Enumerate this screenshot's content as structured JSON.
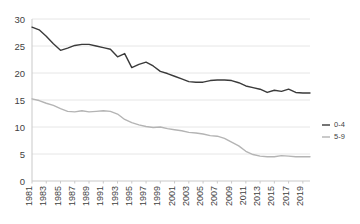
{
  "chart_data": {
    "type": "line",
    "title": "",
    "subtitle": "",
    "xlabel": "",
    "ylabel": "",
    "grid": true,
    "legend_position": "right",
    "ylim": [
      0,
      30
    ],
    "yticks": [
      0,
      5,
      10,
      15,
      20,
      25,
      30
    ],
    "ytick_labels": [
      "0",
      "5",
      "10",
      "15",
      "20",
      "25",
      "30"
    ],
    "xlim": [
      1981,
      2020
    ],
    "xticks": [
      1981,
      1983,
      1985,
      1987,
      1989,
      1991,
      1993,
      1995,
      1997,
      1999,
      2001,
      2003,
      2005,
      2007,
      2009,
      2011,
      2013,
      2015,
      2017,
      2019
    ],
    "xtick_labels": [
      "1981",
      "1983",
      "1985",
      "1987",
      "1989",
      "1991",
      "1993",
      "1995",
      "1997",
      "1999",
      "2001",
      "2003",
      "2005",
      "2007",
      "2009",
      "2011",
      "2013",
      "2015",
      "2017",
      "2019"
    ],
    "x": [
      1981,
      1982,
      1983,
      1984,
      1985,
      1986,
      1987,
      1988,
      1989,
      1990,
      1991,
      1992,
      1993,
      1994,
      1995,
      1996,
      1997,
      1998,
      1999,
      2000,
      2001,
      2002,
      2003,
      2004,
      2005,
      2006,
      2007,
      2008,
      2009,
      2010,
      2011,
      2012,
      2013,
      2014,
      2015,
      2016,
      2017,
      2018,
      2019,
      2020
    ],
    "series": [
      {
        "name": "0-4",
        "color": "#3a3a3a",
        "values": [
          28.5,
          28.0,
          26.8,
          25.4,
          24.2,
          24.6,
          25.1,
          25.3,
          25.3,
          25.0,
          24.7,
          24.4,
          23.0,
          23.6,
          21.0,
          21.6,
          22.0,
          21.3,
          20.3,
          19.9,
          19.4,
          18.9,
          18.4,
          18.3,
          18.3,
          18.6,
          18.7,
          18.7,
          18.6,
          18.2,
          17.6,
          17.3,
          17.0,
          16.4,
          16.8,
          16.6,
          17.0,
          16.4,
          16.3,
          16.3
        ]
      },
      {
        "name": "5-9",
        "color": "#b4b4b4",
        "values": [
          15.2,
          14.9,
          14.4,
          14.0,
          13.4,
          12.9,
          12.8,
          13.0,
          12.8,
          12.9,
          13.0,
          12.9,
          12.4,
          11.4,
          10.8,
          10.4,
          10.1,
          9.9,
          10.0,
          9.7,
          9.5,
          9.3,
          9.0,
          8.9,
          8.7,
          8.4,
          8.3,
          7.9,
          7.2,
          6.5,
          5.5,
          4.9,
          4.6,
          4.5,
          4.5,
          4.7,
          4.6,
          4.5,
          4.5,
          4.5
        ]
      }
    ]
  },
  "legend": {
    "items": [
      {
        "label": "0-4",
        "color": "#3a3a3a"
      },
      {
        "label": "5-9",
        "color": "#b4b4b4"
      }
    ]
  }
}
